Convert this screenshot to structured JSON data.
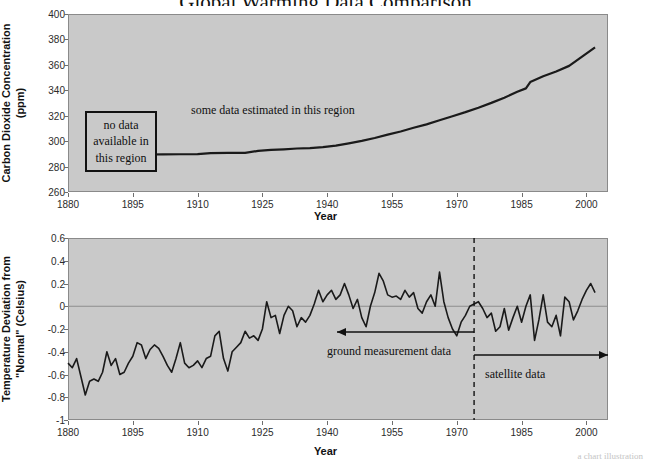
{
  "page": {
    "title_partial": "Global Warming Data Comparison",
    "credit": "a chart illustration"
  },
  "chart_data": [
    {
      "id": "co2",
      "type": "line",
      "title": "",
      "xlabel": "Year",
      "ylabel": "Carbon Dioxide Concentration (ppm)",
      "ylabel_lines": [
        "Carbon Dioxide Concentration",
        "(ppm)"
      ],
      "xlim": [
        1880,
        2005
      ],
      "ylim": [
        260,
        400
      ],
      "yticks": [
        260,
        280,
        300,
        320,
        340,
        360,
        380,
        400
      ],
      "xticks": [
        1880,
        1895,
        1910,
        1925,
        1940,
        1955,
        1970,
        1985,
        2000
      ],
      "grid": false,
      "legend": "none",
      "line_color": "#1a1a1a",
      "plot_bg": "#c9c9c9",
      "series": [
        {
          "name": "Atmospheric CO2",
          "x": [
            1898,
            1902,
            1906,
            1910,
            1913,
            1917,
            1921,
            1924,
            1927,
            1930,
            1933,
            1936,
            1939,
            1942,
            1945,
            1948,
            1951,
            1954,
            1957,
            1960,
            1963,
            1966,
            1969,
            1972,
            1975,
            1978,
            1981,
            1984,
            1986,
            1987,
            1990,
            1993,
            1996,
            1999,
            2002
          ],
          "values": [
            289.5,
            289.6,
            289.7,
            289.8,
            290.6,
            290.7,
            290.8,
            292.3,
            293.2,
            293.6,
            294.2,
            294.5,
            295.3,
            296.5,
            298.3,
            300.2,
            302.5,
            305.1,
            307.6,
            310.5,
            313.2,
            316.4,
            319.6,
            322.8,
            326.3,
            330.1,
            334.2,
            338.8,
            341.5,
            346.5,
            351.0,
            354.8,
            359.2,
            366.5,
            373.8
          ]
        }
      ],
      "annotations": [
        {
          "name": "no-data-box",
          "text_lines": [
            "no data",
            "available in",
            "this region"
          ],
          "style": "boxed"
        },
        {
          "name": "estimated-note",
          "text": "some data estimated in this region",
          "style": "plain"
        }
      ]
    },
    {
      "id": "temperature",
      "type": "line",
      "title": "",
      "xlabel": "Year",
      "ylabel": "Temperature Deviation from \"Normal\" (Celsius)",
      "ylabel_lines": [
        "Temperature Deviation from",
        "\"Normal\" (Celsius)"
      ],
      "xlim": [
        1880,
        2005
      ],
      "ylim": [
        -1,
        0.6
      ],
      "yticks": [
        0.6,
        0.4,
        0.2,
        0,
        -0.2,
        -0.4,
        -0.6,
        -0.8,
        -1
      ],
      "ytick_labels": [
        "0.6",
        "0.4",
        "0.2",
        "0",
        "-0.2",
        "-0.4",
        "-0.6",
        "-0.8",
        "-1"
      ],
      "xticks": [
        1880,
        1895,
        1910,
        1925,
        1940,
        1955,
        1970,
        1985,
        2000
      ],
      "grid": false,
      "zero_line": true,
      "legend": "none",
      "line_color": "#1a1a1a",
      "plot_bg": "#c9c9c9",
      "series": [
        {
          "name": "Temperature deviation",
          "x": [
            1880,
            1881,
            1882,
            1883,
            1884,
            1885,
            1886,
            1887,
            1888,
            1889,
            1890,
            1891,
            1892,
            1893,
            1894,
            1895,
            1896,
            1897,
            1898,
            1899,
            1900,
            1901,
            1902,
            1903,
            1904,
            1905,
            1906,
            1907,
            1908,
            1909,
            1910,
            1911,
            1912,
            1913,
            1914,
            1915,
            1916,
            1917,
            1918,
            1919,
            1920,
            1921,
            1922,
            1923,
            1924,
            1925,
            1926,
            1927,
            1928,
            1929,
            1930,
            1931,
            1932,
            1933,
            1934,
            1935,
            1936,
            1937,
            1938,
            1939,
            1940,
            1941,
            1942,
            1943,
            1944,
            1945,
            1946,
            1947,
            1948,
            1949,
            1950,
            1951,
            1952,
            1953,
            1954,
            1955,
            1956,
            1957,
            1958,
            1959,
            1960,
            1961,
            1962,
            1963,
            1964,
            1965,
            1966,
            1967,
            1968,
            1969,
            1970,
            1971,
            1972,
            1973,
            1974,
            1975,
            1976,
            1977,
            1978,
            1979,
            1980,
            1981,
            1982,
            1983,
            1984,
            1985,
            1986,
            1987,
            1988,
            1989,
            1990,
            1991,
            1992,
            1993,
            1994,
            1995,
            1996,
            1997,
            1998,
            1999,
            2000,
            2001,
            2002
          ],
          "values": [
            -0.5,
            -0.54,
            -0.46,
            -0.62,
            -0.78,
            -0.66,
            -0.64,
            -0.66,
            -0.58,
            -0.4,
            -0.52,
            -0.46,
            -0.6,
            -0.58,
            -0.5,
            -0.44,
            -0.32,
            -0.34,
            -0.46,
            -0.38,
            -0.34,
            -0.37,
            -0.44,
            -0.52,
            -0.58,
            -0.46,
            -0.32,
            -0.5,
            -0.54,
            -0.52,
            -0.48,
            -0.54,
            -0.46,
            -0.44,
            -0.26,
            -0.22,
            -0.46,
            -0.57,
            -0.4,
            -0.36,
            -0.32,
            -0.22,
            -0.28,
            -0.26,
            -0.3,
            -0.2,
            0.04,
            -0.1,
            -0.08,
            -0.24,
            -0.08,
            0.0,
            -0.04,
            -0.18,
            -0.1,
            -0.14,
            -0.08,
            0.02,
            0.14,
            0.04,
            0.1,
            0.14,
            0.06,
            0.1,
            0.2,
            0.1,
            -0.02,
            0.06,
            -0.1,
            -0.18,
            0.0,
            0.12,
            0.29,
            0.22,
            0.1,
            0.08,
            0.09,
            0.06,
            0.14,
            0.08,
            0.12,
            -0.02,
            -0.06,
            0.04,
            0.1,
            0.0,
            0.3,
            0.04,
            -0.1,
            -0.2,
            -0.26,
            -0.14,
            -0.08,
            0.0,
            0.02,
            0.04,
            -0.02,
            -0.1,
            -0.06,
            -0.22,
            -0.18,
            -0.02,
            -0.21,
            -0.1,
            0.0,
            -0.14,
            0.0,
            0.1,
            -0.3,
            -0.12,
            0.1,
            -0.14,
            -0.18,
            -0.08,
            -0.26,
            0.08,
            0.04,
            -0.12,
            -0.04,
            0.06,
            0.14,
            0.2,
            0.12,
            0.18
          ]
        }
      ],
      "annotations": [
        {
          "name": "ground-measurement-label",
          "text": "ground measurement data",
          "arrow": "left"
        },
        {
          "name": "satellite-label",
          "text": "satellite data",
          "arrow": "right"
        },
        {
          "name": "era-divider",
          "text": "",
          "style": "dashed-vertical",
          "x": 1974
        }
      ]
    }
  ]
}
